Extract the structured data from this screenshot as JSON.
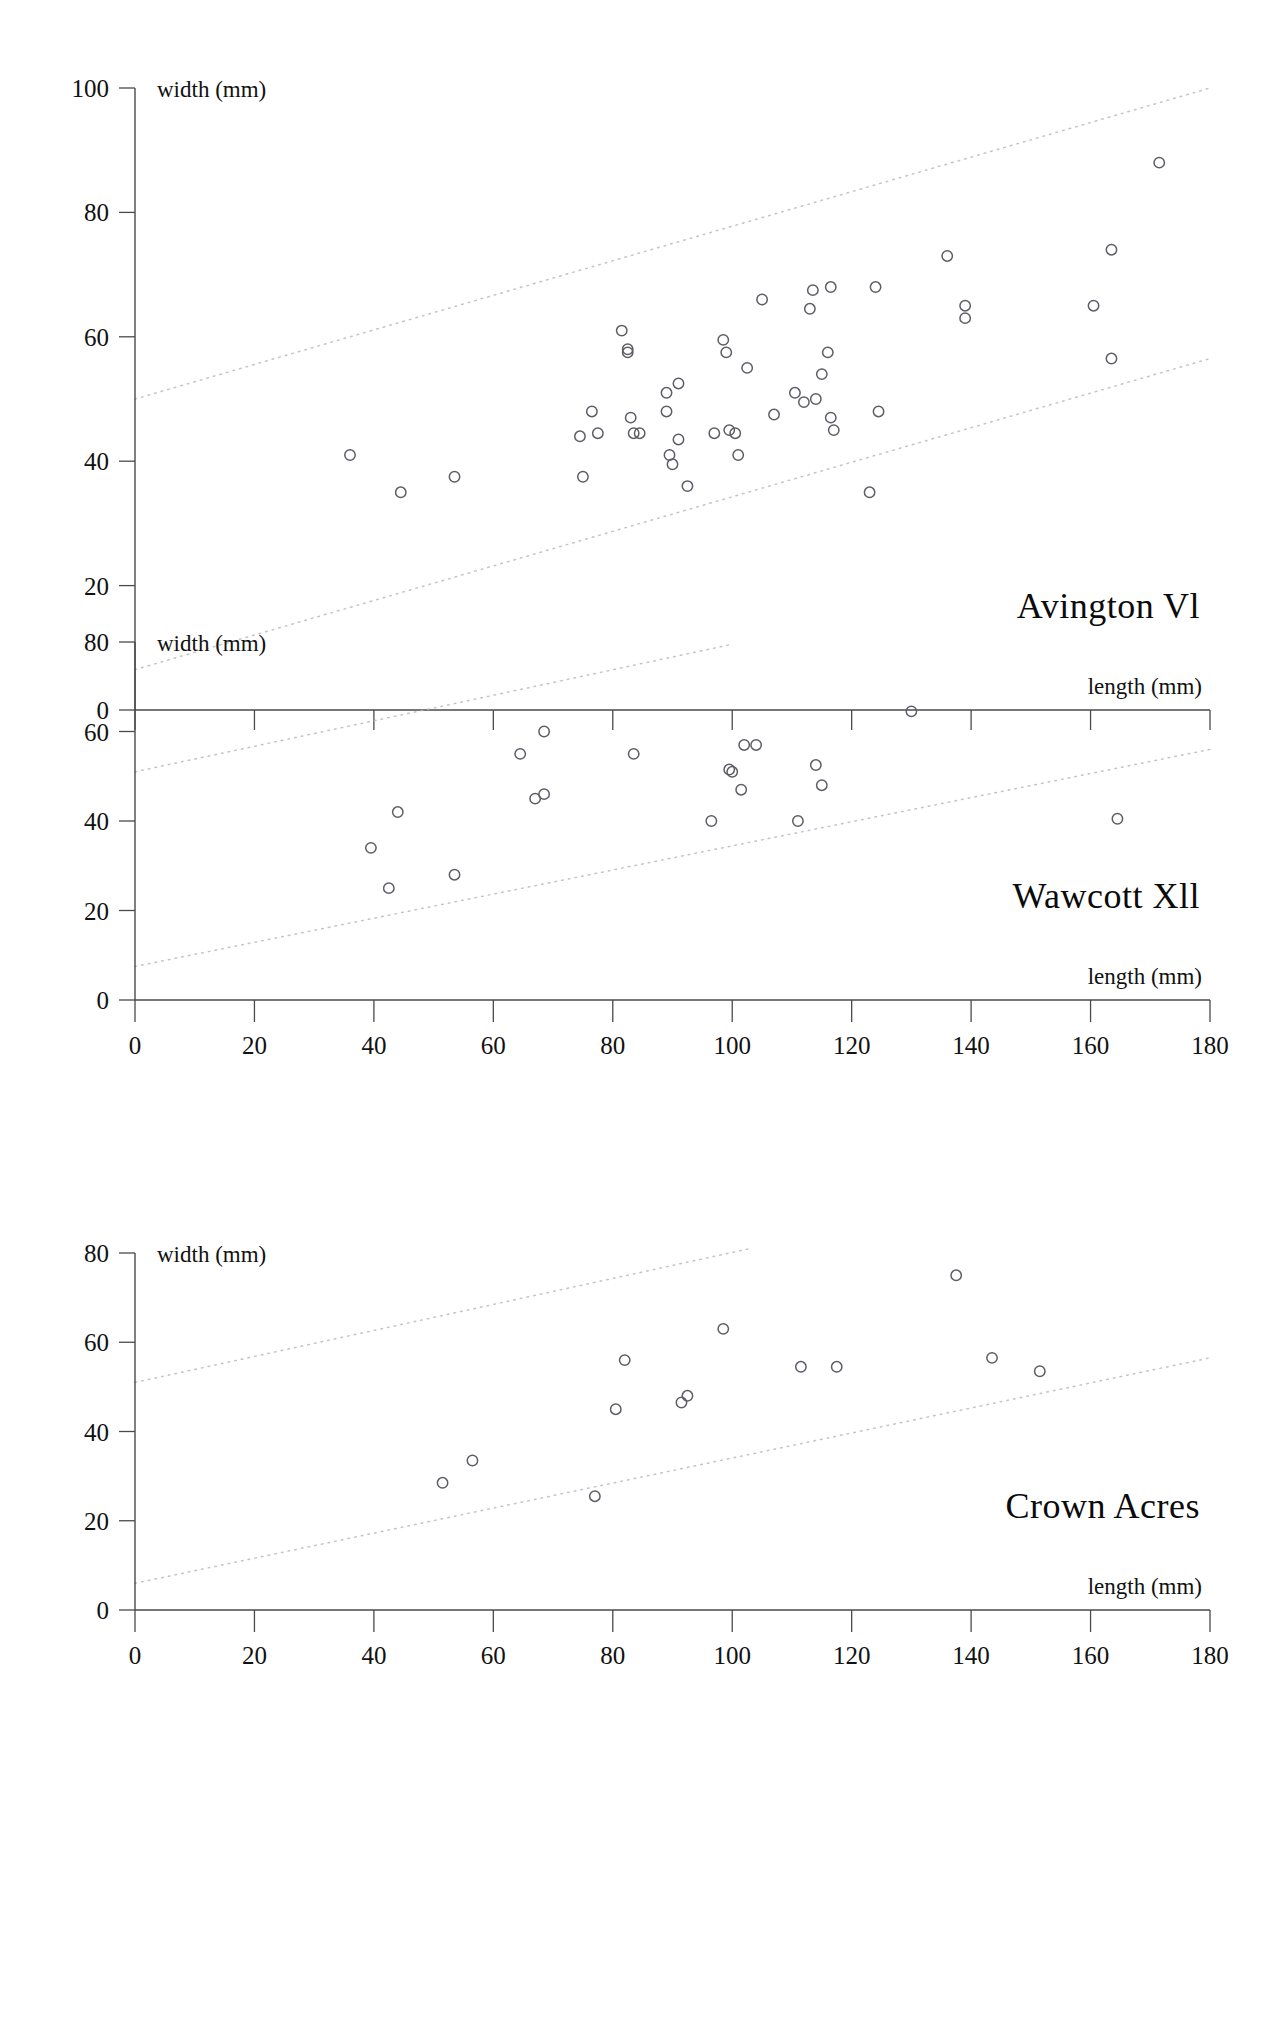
{
  "document": {
    "kind": "figure",
    "panel_count": 3
  },
  "common": {
    "xlabel": "length (mm)",
    "ylabel": "width (mm)",
    "xlim": [
      0,
      180
    ],
    "xticks": [
      0,
      20,
      40,
      60,
      80,
      100,
      120,
      140,
      160,
      180
    ],
    "xticklabels": [
      "0",
      "20",
      "40",
      "60",
      "80",
      "100",
      "120",
      "140",
      "160",
      "180"
    ],
    "marker_style": "open-circle",
    "marker_color": "#5d5d66",
    "band_color": "#b9b9c4",
    "axis_color": "#4a4a4a",
    "grid": false,
    "legend": "none"
  },
  "chart_data": [
    {
      "type": "scatter",
      "title": "Avington Vl",
      "xlabel": "length (mm)",
      "ylabel": "width (mm)",
      "xlim": [
        0,
        180
      ],
      "ylim": [
        0,
        100
      ],
      "xticks": [
        0,
        20,
        40,
        60,
        80,
        100,
        120,
        140,
        160,
        180
      ],
      "yticks": [
        0,
        20,
        40,
        60,
        80,
        100
      ],
      "yticklabels": [
        "0",
        "20",
        "40",
        "60",
        "80",
        "100"
      ],
      "reference_bands": [
        {
          "name": "upper-ratio-line",
          "x": [
            0,
            180
          ],
          "y": [
            50,
            100
          ]
        },
        {
          "name": "lower-ratio-line",
          "x": [
            0,
            180
          ],
          "y": [
            6.5,
            56.5
          ]
        }
      ],
      "points": [
        {
          "x": 36,
          "y": 41
        },
        {
          "x": 44.5,
          "y": 35
        },
        {
          "x": 53.5,
          "y": 37.5
        },
        {
          "x": 74.5,
          "y": 44
        },
        {
          "x": 75,
          "y": 37.5
        },
        {
          "x": 76.5,
          "y": 48
        },
        {
          "x": 77.5,
          "y": 44.5
        },
        {
          "x": 81.5,
          "y": 61
        },
        {
          "x": 82.5,
          "y": 58
        },
        {
          "x": 82.5,
          "y": 57.5
        },
        {
          "x": 83,
          "y": 47
        },
        {
          "x": 83.5,
          "y": 44.5
        },
        {
          "x": 84.5,
          "y": 44.5
        },
        {
          "x": 89,
          "y": 51
        },
        {
          "x": 89,
          "y": 48
        },
        {
          "x": 89.5,
          "y": 41
        },
        {
          "x": 90,
          "y": 39.5
        },
        {
          "x": 91,
          "y": 52.5
        },
        {
          "x": 91,
          "y": 43.5
        },
        {
          "x": 92.5,
          "y": 36
        },
        {
          "x": 97,
          "y": 44.5
        },
        {
          "x": 98.5,
          "y": 59.5
        },
        {
          "x": 99,
          "y": 57.5
        },
        {
          "x": 99.5,
          "y": 45
        },
        {
          "x": 100.5,
          "y": 44.5
        },
        {
          "x": 101,
          "y": 41
        },
        {
          "x": 102.5,
          "y": 55
        },
        {
          "x": 105,
          "y": 66
        },
        {
          "x": 107,
          "y": 47.5
        },
        {
          "x": 110.5,
          "y": 51
        },
        {
          "x": 112,
          "y": 49.5
        },
        {
          "x": 113,
          "y": 64.5
        },
        {
          "x": 113.5,
          "y": 67.5
        },
        {
          "x": 114,
          "y": 50
        },
        {
          "x": 115,
          "y": 54
        },
        {
          "x": 116,
          "y": 57.5
        },
        {
          "x": 116.5,
          "y": 68
        },
        {
          "x": 116.5,
          "y": 47
        },
        {
          "x": 117,
          "y": 45
        },
        {
          "x": 123,
          "y": 35
        },
        {
          "x": 124,
          "y": 68
        },
        {
          "x": 124.5,
          "y": 48
        },
        {
          "x": 136,
          "y": 73
        },
        {
          "x": 139,
          "y": 65
        },
        {
          "x": 139,
          "y": 63
        },
        {
          "x": 160.5,
          "y": 65
        },
        {
          "x": 163.5,
          "y": 74
        },
        {
          "x": 163.5,
          "y": 56.5
        },
        {
          "x": 171.5,
          "y": 88
        }
      ]
    },
    {
      "type": "scatter",
      "title": "Wawcott Xll",
      "xlabel": "length (mm)",
      "ylabel": "width (mm)",
      "xlim": [
        0,
        180
      ],
      "ylim": [
        0,
        80
      ],
      "xticks": [
        0,
        20,
        40,
        60,
        80,
        100,
        120,
        140,
        160,
        180
      ],
      "yticks": [
        0,
        20,
        40,
        60,
        80
      ],
      "yticklabels": [
        "0",
        "20",
        "40",
        "60",
        "80"
      ],
      "reference_bands": [
        {
          "name": "upper-ratio-line",
          "x": [
            0,
            100
          ],
          "y": [
            51,
            79.5
          ]
        },
        {
          "name": "lower-ratio-line",
          "x": [
            0,
            180
          ],
          "y": [
            7.5,
            56
          ]
        }
      ],
      "points": [
        {
          "x": 39.5,
          "y": 34
        },
        {
          "x": 42.5,
          "y": 25
        },
        {
          "x": 44,
          "y": 42
        },
        {
          "x": 53.5,
          "y": 28
        },
        {
          "x": 64.5,
          "y": 55
        },
        {
          "x": 67,
          "y": 45
        },
        {
          "x": 68.5,
          "y": 46
        },
        {
          "x": 68.5,
          "y": 60
        },
        {
          "x": 83.5,
          "y": 55
        },
        {
          "x": 96.5,
          "y": 40
        },
        {
          "x": 99.5,
          "y": 51.5
        },
        {
          "x": 100,
          "y": 51
        },
        {
          "x": 101.5,
          "y": 47
        },
        {
          "x": 102,
          "y": 57
        },
        {
          "x": 104,
          "y": 57
        },
        {
          "x": 111,
          "y": 40
        },
        {
          "x": 114,
          "y": 52.5
        },
        {
          "x": 115,
          "y": 48
        },
        {
          "x": 130,
          "y": 64.5
        },
        {
          "x": 164.5,
          "y": 40.5
        }
      ]
    },
    {
      "type": "scatter",
      "title": "Crown Acres",
      "xlabel": "length (mm)",
      "ylabel": "width (mm)",
      "xlim": [
        0,
        180
      ],
      "ylim": [
        0,
        80
      ],
      "xticks": [
        0,
        20,
        40,
        60,
        80,
        100,
        120,
        140,
        160,
        180
      ],
      "yticks": [
        0,
        20,
        40,
        60,
        80
      ],
      "yticklabels": [
        "0",
        "20",
        "40",
        "60",
        "80"
      ],
      "reference_bands": [
        {
          "name": "upper-ratio-line",
          "x": [
            0,
            103
          ],
          "y": [
            51,
            81
          ]
        },
        {
          "name": "lower-ratio-line",
          "x": [
            0,
            180
          ],
          "y": [
            6,
            56.5
          ]
        }
      ],
      "points": [
        {
          "x": 51.5,
          "y": 28.5
        },
        {
          "x": 56.5,
          "y": 33.5
        },
        {
          "x": 77,
          "y": 25.5
        },
        {
          "x": 80.5,
          "y": 45
        },
        {
          "x": 82,
          "y": 56
        },
        {
          "x": 91.5,
          "y": 46.5
        },
        {
          "x": 92.5,
          "y": 48
        },
        {
          "x": 98.5,
          "y": 63
        },
        {
          "x": 111.5,
          "y": 54.5
        },
        {
          "x": 117.5,
          "y": 54.5
        },
        {
          "x": 137.5,
          "y": 75
        },
        {
          "x": 143.5,
          "y": 56.5
        },
        {
          "x": 151.5,
          "y": 53.5
        }
      ]
    }
  ]
}
